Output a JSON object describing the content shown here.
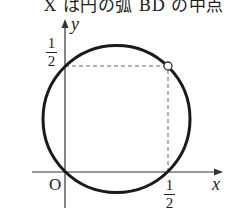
{
  "caption": "X は円の弧 BD の中点",
  "axes": {
    "x_label": "x",
    "y_label": "y",
    "origin_label": "O"
  },
  "ticks": {
    "x_tick": {
      "numerator": "1",
      "denominator": "2"
    },
    "y_tick": {
      "numerator": "1",
      "denominator": "2"
    }
  },
  "figure": {
    "circle": {
      "passes_through": [
        "(0,0)",
        "(1/2,0)",
        "(0,1/2)"
      ],
      "stroke": "#1a1a1a"
    },
    "marked_point": {
      "x": "1/2",
      "y": "1/2",
      "style": "open circle"
    },
    "dashed_guides": [
      "from (0,1/2) to (1/2,1/2)",
      "from (1/2,1/2) to (1/2,0)"
    ]
  }
}
